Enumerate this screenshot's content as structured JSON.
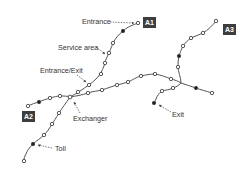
{
  "diagram": {
    "colors": {
      "route": "#555555",
      "node_fill": "#333333",
      "node_hollow": "#ffffff",
      "badge_bg": "#3d3d3d",
      "label": "#333333"
    },
    "badges": [
      {
        "id": "A1",
        "label": "A1"
      },
      {
        "id": "A2",
        "label": "A2"
      },
      {
        "id": "A3",
        "label": "A3"
      }
    ],
    "labels": {
      "entrance": "Entrance",
      "service_area": "Service area",
      "entrance_exit": "Entrance/Exit",
      "exchanger": "Exchanger",
      "toll": "Toll",
      "exit": "Exit"
    }
  }
}
